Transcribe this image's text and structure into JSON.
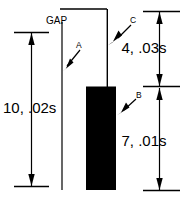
{
  "diagram": {
    "gap_label": "GAP",
    "stroke_color": "#000000",
    "fill_color": "#000000",
    "background_color": "#ffffff",
    "dimensions": [
      {
        "id": "left",
        "label": "10, .02s",
        "count": "10",
        "duration": ".02s"
      },
      {
        "id": "right-upper",
        "label": "4, .03s",
        "count": "4",
        "duration": ".03s"
      },
      {
        "id": "right-lower",
        "label": "7, .01s",
        "count": "7",
        "duration": ".01s"
      }
    ],
    "callouts": [
      {
        "id": "a",
        "label": "A"
      },
      {
        "id": "b",
        "label": "B"
      },
      {
        "id": "c",
        "label": "C"
      }
    ]
  }
}
